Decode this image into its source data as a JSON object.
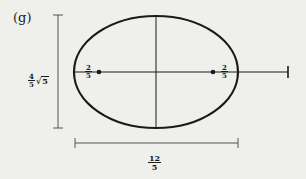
{
  "figure": {
    "part_label": "(g)",
    "height_label": {
      "coefficient_num": "4",
      "coefficient_den": "5",
      "radical": "5",
      "text": "4/5 √5"
    },
    "width_label": {
      "num": "12",
      "den": "5",
      "text": "12/5"
    },
    "focus_left_label": {
      "num": "2",
      "den": "5",
      "text": "2/5"
    },
    "focus_right_label": {
      "num": "2",
      "den": "5",
      "text": "2/5"
    },
    "shape": "ellipse",
    "colors": {
      "background": "#efefeb",
      "stroke": "#1a1a1a",
      "dimension_line": "#555555"
    }
  }
}
